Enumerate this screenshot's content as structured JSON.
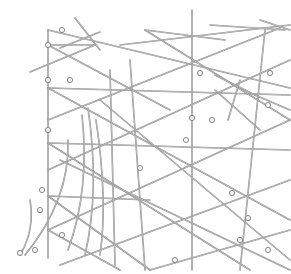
{
  "figure": {
    "background": "#ffffff",
    "stick_color": "#8a8a8a",
    "shell_color": "#f4f4f4",
    "sticks": [
      [
        48,
        30,
        290,
        88
      ],
      [
        48,
        30,
        48,
        258
      ],
      [
        48,
        88,
        290,
        95
      ],
      [
        48,
        143,
        290,
        150
      ],
      [
        48,
        196,
        150,
        200
      ],
      [
        75,
        18,
        100,
        50
      ],
      [
        60,
        48,
        100,
        32
      ],
      [
        48,
        45,
        95,
        45
      ],
      [
        30,
        72,
        95,
        45
      ],
      [
        48,
        45,
        170,
        110
      ],
      [
        48,
        88,
        290,
        220
      ],
      [
        48,
        143,
        250,
        270
      ],
      [
        48,
        196,
        150,
        270
      ],
      [
        120,
        45,
        290,
        25
      ],
      [
        48,
        120,
        280,
        28
      ],
      [
        48,
        170,
        290,
        60
      ],
      [
        48,
        230,
        290,
        120
      ],
      [
        60,
        265,
        290,
        180
      ],
      [
        150,
        270,
        290,
        230
      ],
      [
        192,
        10,
        192,
        270
      ],
      [
        265,
        30,
        240,
        270
      ],
      [
        130,
        60,
        145,
        270
      ],
      [
        110,
        70,
        115,
        265
      ],
      [
        145,
        30,
        290,
        120
      ],
      [
        145,
        30,
        225,
        40
      ],
      [
        210,
        25,
        285,
        30
      ],
      [
        260,
        20,
        290,
        30
      ],
      [
        100,
        100,
        290,
        260
      ],
      [
        60,
        160,
        290,
        270
      ],
      [
        48,
        230,
        120,
        270
      ],
      [
        215,
        75,
        255,
        95
      ],
      [
        255,
        95,
        290,
        110
      ],
      [
        215,
        90,
        260,
        130
      ],
      [
        240,
        80,
        228,
        120
      ]
    ],
    "curves": [
      "M 82 115 Q 90 190 68 250",
      "M 88 108 Q 100 190 85 255",
      "M 96 120 Q 108 200 100 255",
      "M 68 140 Q 70 200 25 255",
      "M 30 200 Q 35 230 20 255"
    ],
    "shells": [
      [
        48,
        45
      ],
      [
        48,
        80
      ],
      [
        48,
        130
      ],
      [
        70,
        80
      ],
      [
        62,
        30
      ],
      [
        200,
        73
      ],
      [
        270,
        73
      ],
      [
        268,
        105
      ],
      [
        192,
        118
      ],
      [
        62,
        235
      ],
      [
        212,
        120
      ],
      [
        186,
        140
      ],
      [
        232,
        193
      ],
      [
        248,
        218
      ],
      [
        268,
        250
      ],
      [
        140,
        168
      ],
      [
        35,
        250
      ],
      [
        40,
        210
      ],
      [
        42,
        190
      ],
      [
        20,
        253
      ],
      [
        175,
        260
      ],
      [
        240,
        240
      ]
    ]
  }
}
